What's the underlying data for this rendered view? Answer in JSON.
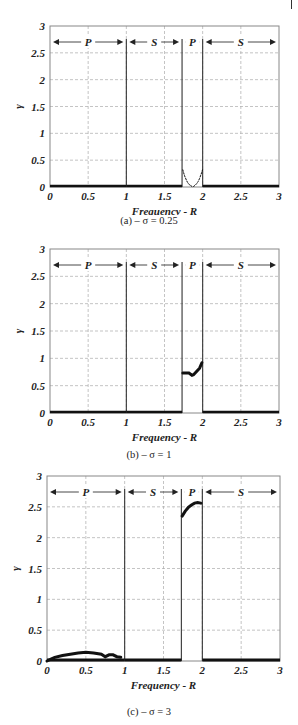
{
  "chart_data": [
    {
      "type": "scatter",
      "title": "",
      "caption": "(a) – σ = 0.25",
      "xlabel": "Frequency - R",
      "ylabel": "γ",
      "xlim": [
        0,
        3
      ],
      "ylim": [
        0,
        3
      ],
      "xticks": [
        "0",
        "0.5",
        "1",
        "1.5",
        "2",
        "2.5",
        "3"
      ],
      "yticks": [
        "0",
        "0.5",
        "1",
        "1.5",
        "2",
        "2.5",
        "3"
      ],
      "grid": true,
      "regions": [
        {
          "label": "P",
          "from": 0,
          "to": 1
        },
        {
          "label": "S",
          "from": 1,
          "to": 1.73
        },
        {
          "label": "P",
          "from": 1.73,
          "to": 2
        },
        {
          "label": "S",
          "from": 2,
          "to": 3
        }
      ],
      "boundaries": [
        1,
        1.73,
        2
      ],
      "series": [
        {
          "name": "γ",
          "x": [
            0,
            0.25,
            0.5,
            0.75,
            1.0,
            1.25,
            1.5,
            1.72,
            1.74,
            1.76,
            1.78,
            1.8,
            1.82,
            1.84,
            1.86,
            1.88,
            1.9,
            1.92,
            1.94,
            1.96,
            1.98,
            2.0,
            2.25,
            2.5,
            2.75,
            3.0
          ],
          "y": [
            0,
            0,
            0,
            0,
            0,
            0,
            0,
            0,
            0.32,
            0.22,
            0.15,
            0.09,
            0.05,
            0.03,
            0.01,
            0.01,
            0.03,
            0.06,
            0.1,
            0.16,
            0.24,
            0.33,
            0,
            0,
            0,
            0
          ]
        }
      ]
    },
    {
      "type": "scatter",
      "title": "",
      "caption": "(b) – σ = 1",
      "xlabel": "Frequency - R",
      "ylabel": "γ",
      "xlim": [
        0,
        3
      ],
      "ylim": [
        0,
        3
      ],
      "xticks": [
        "0",
        "0.5",
        "1",
        "1.5",
        "2",
        "2.5",
        "3"
      ],
      "yticks": [
        "0",
        "0.5",
        "1",
        "1.5",
        "2",
        "2.5",
        "3"
      ],
      "grid": true,
      "regions": [
        {
          "label": "P",
          "from": 0,
          "to": 1
        },
        {
          "label": "S",
          "from": 1,
          "to": 1.73
        },
        {
          "label": "P",
          "from": 1.73,
          "to": 2
        },
        {
          "label": "S",
          "from": 2,
          "to": 3
        }
      ],
      "boundaries": [
        1,
        1.73,
        2
      ],
      "series": [
        {
          "name": "γ",
          "x": [
            0,
            0.25,
            0.5,
            0.75,
            0.95,
            1.0,
            1.25,
            1.5,
            1.72,
            1.74,
            1.78,
            1.82,
            1.86,
            1.88,
            1.92,
            1.96,
            1.99,
            2.0,
            2.25,
            2.5,
            2.75,
            3.0
          ],
          "y": [
            0,
            0,
            0,
            0,
            0.01,
            0,
            0,
            0,
            0,
            0.73,
            0.73,
            0.73,
            0.69,
            0.7,
            0.76,
            0.82,
            0.92,
            0,
            0,
            0,
            0,
            0
          ]
        }
      ]
    },
    {
      "type": "scatter",
      "title": "",
      "caption": "(c) – σ = 3",
      "xlabel": "Frequency - R",
      "ylabel": "γ",
      "xlim": [
        0,
        3
      ],
      "ylim": [
        0,
        3
      ],
      "xticks": [
        "0",
        "0.5",
        "1",
        "1.5",
        "2",
        "2.5",
        "3"
      ],
      "yticks": [
        "0",
        "0.5",
        "1",
        "1.5",
        "2",
        "2.5",
        "3"
      ],
      "grid": true,
      "regions": [
        {
          "label": "P",
          "from": 0,
          "to": 1
        },
        {
          "label": "S",
          "from": 1,
          "to": 1.73
        },
        {
          "label": "P",
          "from": 1.73,
          "to": 2
        },
        {
          "label": "S",
          "from": 2,
          "to": 3
        }
      ],
      "boundaries": [
        1,
        1.73,
        2
      ],
      "series": [
        {
          "name": "γ",
          "x": [
            0,
            0.05,
            0.1,
            0.2,
            0.3,
            0.4,
            0.5,
            0.6,
            0.7,
            0.75,
            0.8,
            0.85,
            0.9,
            0.95,
            1.0,
            1.25,
            1.5,
            1.72,
            1.74,
            1.78,
            1.82,
            1.86,
            1.9,
            1.94,
            1.98,
            2.0,
            2.25,
            2.5,
            2.75,
            3.0
          ],
          "y": [
            0,
            0.03,
            0.06,
            0.09,
            0.11,
            0.13,
            0.14,
            0.13,
            0.11,
            0.07,
            0.1,
            0.1,
            0.07,
            0.06,
            0,
            0,
            0,
            0,
            2.35,
            2.43,
            2.49,
            2.53,
            2.56,
            2.57,
            2.56,
            0,
            0,
            0,
            0,
            0
          ]
        }
      ]
    }
  ]
}
